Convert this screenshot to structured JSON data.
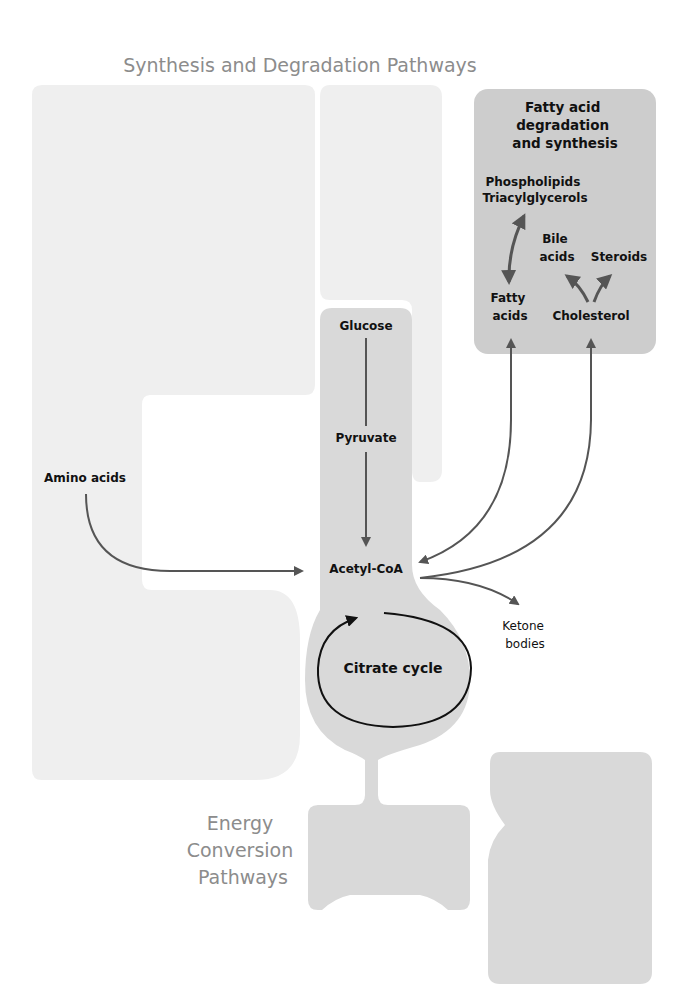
{
  "title": "Synthesis and Degradation Pathways",
  "bottom_label": [
    "Energy",
    "Conversion",
    "Pathways"
  ],
  "colors": {
    "light_region": "#efefef",
    "mid_region": "#d9d9d9",
    "fatty_box": "#cdcdcd",
    "arrow": "#555555",
    "cycle_arrow": "#111111",
    "title_text": "#8c8c8c"
  },
  "fatty_box": {
    "title_lines": [
      "Fatty acid",
      "degradation",
      "and synthesis"
    ],
    "phospholipids": [
      "Phospholipids",
      "Triacylglycerols"
    ],
    "bile_acids": [
      "Bile",
      "acids"
    ],
    "steroids": "Steroids",
    "fatty_acids": [
      "Fatty",
      "acids"
    ],
    "cholesterol": "Cholesterol"
  },
  "nodes": {
    "glucose": "Glucose",
    "pyruvate": "Pyruvate",
    "acetyl_coa": "Acetyl-CoA",
    "amino_acids": "Amino acids",
    "ketone_bodies": [
      "Ketone",
      "bodies"
    ],
    "citrate_cycle": "Citrate cycle"
  }
}
